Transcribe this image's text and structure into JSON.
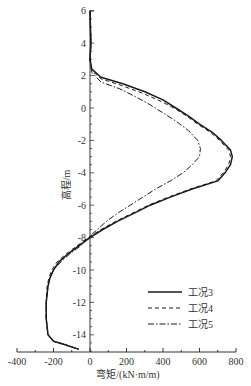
{
  "chart_data": {
    "type": "line",
    "title": "",
    "xlabel": "弯矩/(kN·m/m)",
    "ylabel": "高程/m",
    "xlim": [
      -400,
      800
    ],
    "ylim": [
      -15,
      6
    ],
    "x_ticks": [
      -400,
      -200,
      0,
      200,
      400,
      600,
      800
    ],
    "y_ticks": [
      6,
      4,
      2,
      0,
      -2,
      -4,
      -6,
      -8,
      -10,
      -12,
      -14
    ],
    "grid": false,
    "legend_position": "lower right",
    "series": [
      {
        "name": "工况3",
        "style": "solid",
        "points": [
          [
            0,
            6
          ],
          [
            5,
            4
          ],
          [
            0,
            3
          ],
          [
            10,
            2.4
          ],
          [
            60,
            1.9
          ],
          [
            180,
            1.5
          ],
          [
            300,
            1
          ],
          [
            400,
            0.5
          ],
          [
            470,
            0
          ],
          [
            540,
            -0.5
          ],
          [
            600,
            -1
          ],
          [
            670,
            -1.5
          ],
          [
            720,
            -2
          ],
          [
            770,
            -2.6
          ],
          [
            780,
            -3
          ],
          [
            770,
            -3.5
          ],
          [
            740,
            -4
          ],
          [
            700,
            -4.5
          ],
          [
            560,
            -5
          ],
          [
            440,
            -5.5
          ],
          [
            330,
            -6
          ],
          [
            240,
            -6.5
          ],
          [
            150,
            -7
          ],
          [
            70,
            -7.5
          ],
          [
            0,
            -8
          ],
          [
            -60,
            -8.5
          ],
          [
            -120,
            -9
          ],
          [
            -170,
            -9.5
          ],
          [
            -200,
            -10
          ],
          [
            -220,
            -10.5
          ],
          [
            -230,
            -11
          ],
          [
            -240,
            -12
          ],
          [
            -240,
            -13
          ],
          [
            -230,
            -14
          ],
          [
            -200,
            -14.4
          ],
          [
            -140,
            -14.6
          ],
          [
            -60,
            -14.9
          ]
        ]
      },
      {
        "name": "工况4",
        "style": "dashed",
        "points": [
          [
            0,
            6
          ],
          [
            5,
            4
          ],
          [
            0,
            3
          ],
          [
            10,
            2.3
          ],
          [
            60,
            1.8
          ],
          [
            170,
            1.4
          ],
          [
            290,
            0.9
          ],
          [
            390,
            0.4
          ],
          [
            460,
            0
          ],
          [
            530,
            -0.5
          ],
          [
            590,
            -1
          ],
          [
            660,
            -1.5
          ],
          [
            710,
            -2
          ],
          [
            760,
            -2.6
          ],
          [
            770,
            -3
          ],
          [
            760,
            -3.5
          ],
          [
            730,
            -4
          ],
          [
            690,
            -4.5
          ],
          [
            550,
            -5
          ],
          [
            430,
            -5.5
          ],
          [
            320,
            -6
          ],
          [
            230,
            -6.5
          ],
          [
            140,
            -7
          ],
          [
            60,
            -7.5
          ],
          [
            -10,
            -8
          ],
          [
            -70,
            -8.5
          ],
          [
            -130,
            -9
          ],
          [
            -180,
            -9.5
          ],
          [
            -210,
            -10
          ],
          [
            -225,
            -10.5
          ],
          [
            -235,
            -11
          ],
          [
            -240,
            -12
          ],
          [
            -240,
            -13
          ],
          [
            -230,
            -14
          ],
          [
            -200,
            -14.4
          ],
          [
            -140,
            -14.6
          ],
          [
            -60,
            -14.9
          ]
        ]
      },
      {
        "name": "工况5",
        "style": "dash-dot",
        "points": [
          [
            0,
            6
          ],
          [
            5,
            4
          ],
          [
            0,
            3
          ],
          [
            10,
            2.2
          ],
          [
            60,
            1.6
          ],
          [
            160,
            1.2
          ],
          [
            250,
            0.7
          ],
          [
            330,
            0.2
          ],
          [
            400,
            -0.3
          ],
          [
            470,
            -0.8
          ],
          [
            540,
            -1.4
          ],
          [
            590,
            -2
          ],
          [
            605,
            -2.5
          ],
          [
            600,
            -3
          ],
          [
            560,
            -3.5
          ],
          [
            510,
            -4
          ],
          [
            440,
            -4.5
          ],
          [
            360,
            -5
          ],
          [
            290,
            -5.5
          ],
          [
            220,
            -6
          ],
          [
            150,
            -6.5
          ],
          [
            90,
            -7
          ],
          [
            40,
            -7.5
          ],
          [
            0,
            -7.9
          ],
          [
            -50,
            -8.5
          ],
          [
            -110,
            -9
          ],
          [
            -160,
            -9.5
          ],
          [
            -200,
            -10
          ],
          [
            -220,
            -10.5
          ],
          [
            -230,
            -11
          ],
          [
            -240,
            -12
          ],
          [
            -240,
            -13
          ],
          [
            -230,
            -14
          ],
          [
            -200,
            -14.4
          ],
          [
            -140,
            -14.6
          ],
          [
            -60,
            -14.9
          ]
        ]
      }
    ]
  },
  "axes": {
    "x_tick_labels": [
      "-400",
      "-200",
      "0",
      "200",
      "400",
      "600",
      "800"
    ],
    "y_tick_labels": [
      "6",
      "4",
      "2",
      "0",
      "-2",
      "-4",
      "-6",
      "-8",
      "-10",
      "-12",
      "-14"
    ],
    "xlabel": "弯矩/(kN·m/m)",
    "ylabel": "高程/m"
  },
  "legend": {
    "items": [
      {
        "label": "工况3",
        "style": "solid"
      },
      {
        "label": "工况4",
        "style": "dashed"
      },
      {
        "label": "工况5",
        "style": "dash-dot"
      }
    ]
  },
  "colors": {
    "line": "#1a1a1a",
    "axis": "#333333"
  }
}
